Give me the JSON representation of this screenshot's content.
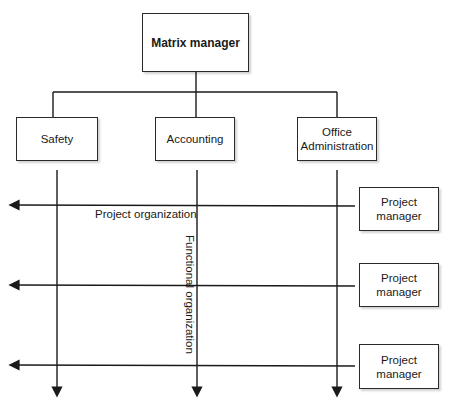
{
  "diagram": {
    "top": {
      "label": "Matrix manager"
    },
    "departments": [
      {
        "label": "Safety"
      },
      {
        "label": "Accounting"
      },
      {
        "label": "Office Administration"
      }
    ],
    "project_managers": [
      {
        "label": "Project manager"
      },
      {
        "label": "Project manager"
      },
      {
        "label": "Project manager"
      }
    ],
    "annotations": {
      "horizontal": "Project organization",
      "vertical": "Functional organization"
    }
  }
}
